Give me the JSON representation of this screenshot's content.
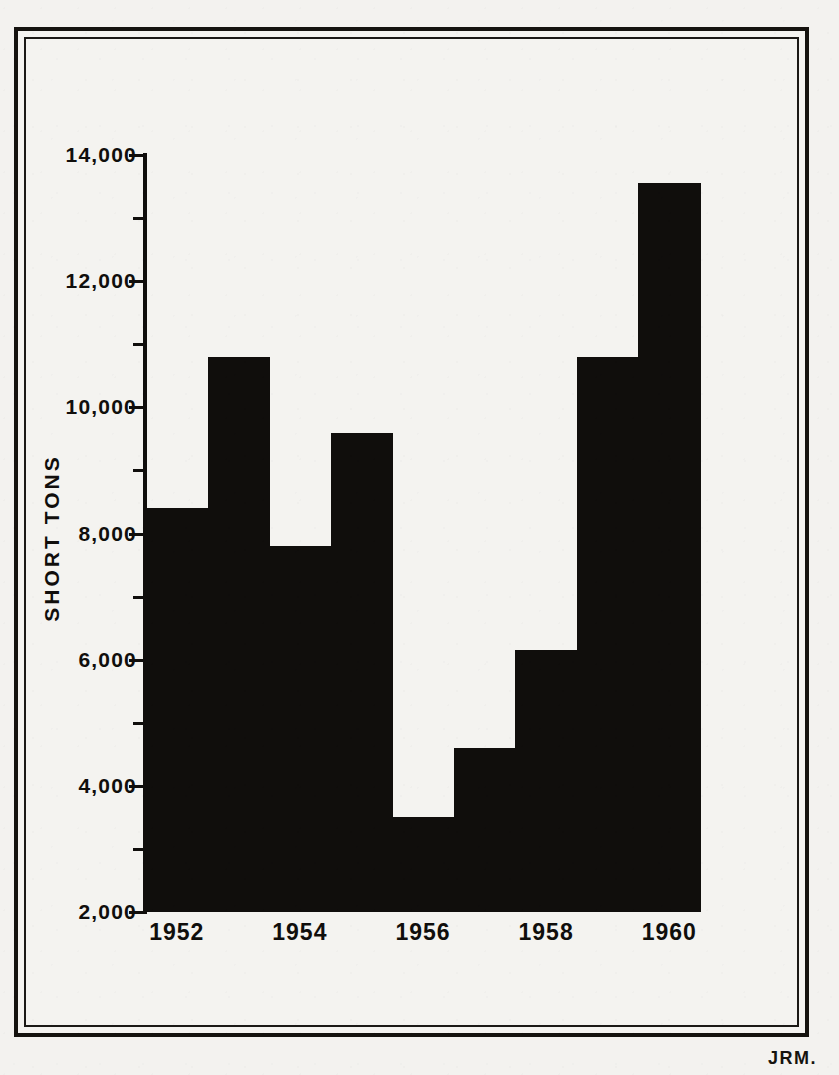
{
  "figure": {
    "signature": "JRM.",
    "ink_color": "#100e0c",
    "paper_color": "#f3f2ef"
  },
  "axis": {
    "y_label": "SHORT TONS",
    "y_tick_labels": [
      "14,000",
      "12,000",
      "10,000",
      "8,000",
      "6,000",
      "4,000",
      "2,000"
    ],
    "x_tick_labels": [
      "1952",
      "1954",
      "1956",
      "1958",
      "1960"
    ]
  },
  "chart_data": {
    "type": "bar",
    "title": "",
    "xlabel": "",
    "ylabel": "SHORT TONS",
    "categories": [
      "1952",
      "1953",
      "1954",
      "1955",
      "1956",
      "1957",
      "1958",
      "1959",
      "1960"
    ],
    "values": [
      8400,
      10800,
      7800,
      9600,
      3500,
      4600,
      6150,
      10800,
      13550
    ],
    "ylim": [
      2000,
      14000
    ],
    "y_major_ticks": [
      2000,
      4000,
      6000,
      8000,
      10000,
      12000,
      14000
    ],
    "y_minor_ticks": [
      3000,
      5000,
      7000,
      9000,
      11000,
      13000
    ],
    "xlim_categories": [
      "1952",
      "1960"
    ],
    "labeled_x_ticks": [
      1952,
      1954,
      1956,
      1958,
      1960
    ],
    "grid": false,
    "legend": null,
    "bar_gap": 0,
    "baseline": 2000,
    "series": [
      {
        "name": "Short tons",
        "values": [
          8400,
          10800,
          7800,
          9600,
          3500,
          4600,
          6150,
          10800,
          13550
        ]
      }
    ]
  }
}
